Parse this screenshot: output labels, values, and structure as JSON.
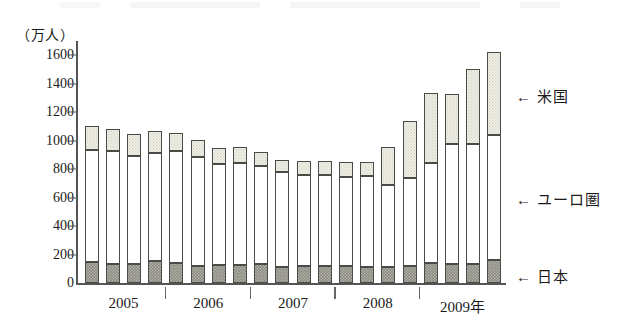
{
  "chart_data": {
    "type": "bar",
    "subtype": "stacked-vertical",
    "title": "",
    "xlabel": "",
    "ylabel": "",
    "unit_label": "（万人）",
    "ylim": [
      0,
      1700
    ],
    "yticks": [
      0,
      200,
      400,
      600,
      800,
      1000,
      1200,
      1400,
      1600
    ],
    "ytick_labels": [
      "0",
      "200",
      "400",
      "600",
      "800",
      "1000",
      "1200",
      "1400",
      "1600"
    ],
    "grid": false,
    "legend_position": "right-inline-arrows",
    "group_labels": [
      "2005",
      "2006",
      "2007",
      "2008",
      "2009年"
    ],
    "categories": [
      "2005Q1",
      "2005Q2",
      "2005Q3",
      "2005Q4",
      "2006Q1",
      "2006Q2",
      "2006Q3",
      "2006Q4",
      "2007Q1",
      "2007Q2",
      "2007Q3",
      "2007Q4",
      "2008Q1",
      "2008Q2",
      "2008Q3",
      "2008Q4",
      "2009Q1",
      "2009Q2",
      "2009Q3",
      "2009Q4"
    ],
    "series": [
      {
        "name": "日本",
        "key": "japan",
        "style": "dark-gray-hatch",
        "color": "#8d8d84",
        "values": [
          150,
          135,
          135,
          155,
          140,
          120,
          128,
          130,
          132,
          110,
          120,
          118,
          118,
          112,
          112,
          120,
          138,
          135,
          135,
          165
        ]
      },
      {
        "name": "ユーロ圏",
        "key": "eurozone",
        "style": "white",
        "color": "#ffffff",
        "values": [
          785,
          795,
          760,
          760,
          785,
          765,
          705,
          715,
          690,
          670,
          640,
          640,
          628,
          638,
          578,
          620,
          705,
          845,
          845,
          875
        ]
      },
      {
        "name": "米国",
        "key": "usa",
        "style": "stippled-cream",
        "color": "#eeeee4",
        "values": [
          165,
          150,
          150,
          150,
          130,
          118,
          115,
          110,
          98,
          85,
          100,
          102,
          104,
          100,
          265,
          400,
          490,
          350,
          520,
          580
        ]
      }
    ],
    "totals": [
      1100,
      1080,
      1045,
      1065,
      1055,
      1003,
      948,
      955,
      920,
      865,
      860,
      860,
      850,
      850,
      955,
      1140,
      1333,
      1330,
      1500,
      1620
    ]
  },
  "legend": {
    "items": [
      {
        "arrow": "←",
        "label": "米国",
        "name": "legend-usa"
      },
      {
        "arrow": "←",
        "label": "ユーロ圏",
        "name": "legend-eurozone"
      },
      {
        "arrow": "←",
        "label": "日本",
        "name": "legend-japan"
      }
    ]
  }
}
